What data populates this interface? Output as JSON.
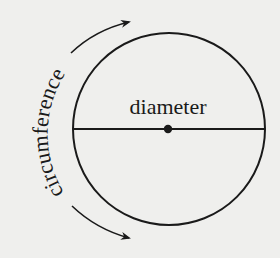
{
  "diagram": {
    "type": "labeled-circle",
    "labels": {
      "diameter": "diameter",
      "circumference": "circumference"
    },
    "circle": {
      "cx": 169,
      "cy": 129,
      "r": 96,
      "stroke": "#1a1a1a"
    },
    "diameter_line": {
      "x1": 73,
      "y1": 129,
      "x2": 265,
      "y2": 129
    },
    "center_dot": {
      "cx": 168,
      "cy": 129,
      "r": 4
    },
    "arrows": [
      {
        "name": "circumference-arrow-up",
        "direction": "clockwise-toward-top"
      },
      {
        "name": "circumference-arrow-down",
        "direction": "counterclockwise-toward-bottom"
      }
    ],
    "colors": {
      "background": "#efefed",
      "ink": "#1a1a1a"
    }
  }
}
